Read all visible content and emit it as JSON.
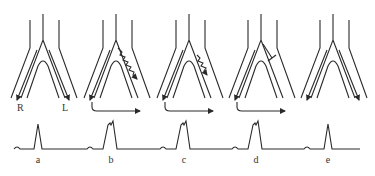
{
  "figure": {
    "stroke_color": "#2a2a2a",
    "side_labels": {
      "right": "R",
      "left": "L"
    },
    "panels": [
      {
        "id": "a",
        "label": "a",
        "center_x": 43,
        "signal": "none",
        "reentry_arrow": false,
        "peak": "narrow"
      },
      {
        "id": "b",
        "label": "b",
        "center_x": 116,
        "signal": "zigzag-long",
        "reentry_arrow": true,
        "peak": "wide"
      },
      {
        "id": "c",
        "label": "c",
        "center_x": 189,
        "signal": "zigzag-short",
        "reentry_arrow": true,
        "peak": "wide"
      },
      {
        "id": "d",
        "label": "d",
        "center_x": 261,
        "signal": "block-bar",
        "reentry_arrow": true,
        "peak": "wide"
      },
      {
        "id": "e",
        "label": "e",
        "center_x": 333,
        "signal": "none",
        "reentry_arrow": false,
        "peak": "narrow"
      }
    ],
    "trace": {
      "baseline_y": 149,
      "x_start": 14,
      "x_end": 360
    }
  }
}
